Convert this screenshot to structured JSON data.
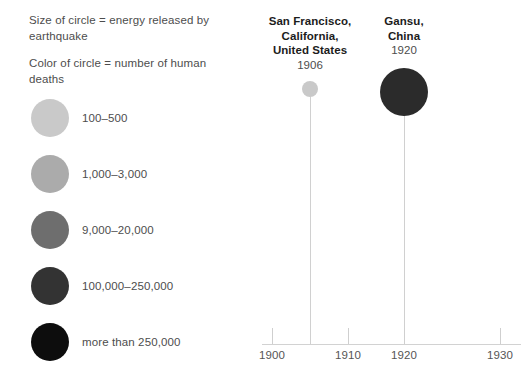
{
  "legend": {
    "note_size": "Size of circle = energy released by earthquake",
    "note_color": "Color of circle = number of human deaths",
    "items": [
      {
        "label": "100–500",
        "color": "#c9c9c9",
        "top": 99
      },
      {
        "label": "1,000–3,000",
        "color": "#ababab",
        "top": 155
      },
      {
        "label": "9,000–20,000",
        "color": "#6e6e6e",
        "top": 211
      },
      {
        "label": "100,000–250,000",
        "color": "#333333",
        "top": 267
      },
      {
        "label": "more than 250,000",
        "color": "#0d0d0d",
        "top": 323
      }
    ]
  },
  "chart_data": {
    "type": "scatter",
    "title": "",
    "xlabel": "",
    "ylabel": "",
    "xlim": [
      1896,
      1936
    ],
    "grid": false,
    "legend_position": "left-panel",
    "size_encoding": "energy released by earthquake",
    "color_encoding": "number of human deaths",
    "axis_ticks": [
      {
        "label": "1900",
        "x": 17
      },
      {
        "label": "1910",
        "x": 93
      },
      {
        "label": "1920",
        "x": 149
      },
      {
        "label": "1930",
        "x": 245
      }
    ],
    "points": [
      {
        "place": [
          "San Francisco,",
          "California,",
          "United States"
        ],
        "year": "1906",
        "x": 55,
        "cy": 89,
        "diameter": 16,
        "color": "#c9c9c9",
        "label_top": 14
      },
      {
        "place": [
          "Gansu,",
          "China"
        ],
        "year": "1920",
        "x": 149,
        "cy": 92,
        "diameter": 48,
        "color": "#2b2b2b",
        "label_top": 14
      }
    ]
  }
}
